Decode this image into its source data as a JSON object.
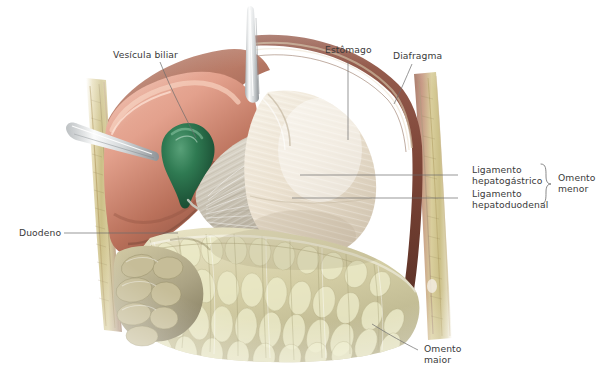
{
  "figure": {
    "background_color": "#ffffff",
    "label_color": "#3a3a3a",
    "leader_color": "#6b6b6b"
  },
  "labels": {
    "vesicula_biliar": "Vesícula biliar",
    "estomago": "Estômago",
    "diafragma": "Diafragma",
    "duodeno": "Duodeno",
    "ligamento_hepatogastrico": "Ligamento\nhepatogástrico",
    "ligamento_hepatoduodenal": "Ligamento\nhepatoduodenal",
    "omento_menor": "Omento\nmenor",
    "omento_maior": "Omento\nmaior"
  },
  "caption": "",
  "structures": {
    "liver": {
      "name": "Fígado",
      "color": "#e3a18d",
      "shade": "#b06a52"
    },
    "gallbladder": {
      "name": "Vesícula biliar",
      "color": "#235c3d",
      "highlight": "#4d8f68"
    },
    "stomach": {
      "name": "Estômago",
      "color": "#ece3d4"
    },
    "lesser_omentum": {
      "name": "Omento menor",
      "color": "#d9d4c6"
    },
    "greater_omentum": {
      "name": "Omento maior",
      "color": "#d8d3ae"
    },
    "bowel": {
      "name": "Alças intestinais",
      "color": "#b5ad8a"
    },
    "abdominal_wall": {
      "name": "Parede abdominal",
      "fat": "#d9cf9b",
      "muscle": "#c08a7c"
    },
    "diaphragm": {
      "name": "Diafragma",
      "color": "#8a5247"
    },
    "retractor": {
      "name": "Afastador cirúrgico",
      "color": "#d7d9da"
    }
  }
}
